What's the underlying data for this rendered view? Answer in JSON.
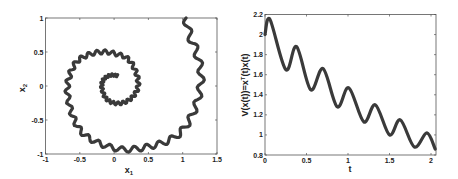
{
  "chart_data": [
    {
      "type": "line",
      "title": "",
      "xlabel": "x1",
      "ylabel": "x2",
      "xlim": [
        -1,
        1.5
      ],
      "ylim": [
        -1,
        1
      ],
      "xticks": [
        "-1",
        "-0.5",
        "0",
        "0.5",
        "1",
        "1.5"
      ],
      "yticks": [
        "-1",
        "-0.5",
        "0",
        "0.5",
        "1"
      ],
      "grid": false,
      "description": "Phase-plane trajectory spiraling inward (clockwise) with small high-frequency ripples, from about (1.05, 1.0) to about (0.05, 0.15)",
      "series": [
        {
          "name": "trajectory",
          "x": [
            1.05,
            1.1,
            1.2,
            1.27,
            1.22,
            1.1,
            0.95,
            0.75,
            0.55,
            0.35,
            0.1,
            -0.2,
            -0.45,
            -0.6,
            -0.68,
            -0.65,
            -0.55,
            -0.4,
            -0.2,
            0.0,
            0.2,
            0.32,
            0.35,
            0.28,
            0.15,
            0.0,
            -0.12,
            -0.18,
            -0.15,
            -0.05,
            0.05
          ],
          "y": [
            1.0,
            0.75,
            0.5,
            0.15,
            -0.2,
            -0.5,
            -0.7,
            -0.82,
            -0.88,
            -0.92,
            -0.93,
            -0.85,
            -0.7,
            -0.45,
            -0.1,
            0.15,
            0.35,
            0.45,
            0.5,
            0.48,
            0.4,
            0.2,
            0.0,
            -0.15,
            -0.24,
            -0.25,
            -0.18,
            -0.02,
            0.1,
            0.16,
            0.15
          ]
        }
      ]
    },
    {
      "type": "line",
      "title": "",
      "xlabel": "t",
      "ylabel": "V(x(t))=x^T(t)x(t)",
      "xlim": [
        0,
        2.06
      ],
      "ylim": [
        0.8,
        2.2
      ],
      "xticks": [
        "0",
        "0.5",
        "1",
        "1.5",
        "2"
      ],
      "yticks": [
        "0.8",
        "1",
        "1.2",
        "1.4",
        "1.6",
        "1.8",
        "2",
        "2.2"
      ],
      "grid": false,
      "series": [
        {
          "name": "V",
          "x": [
            0,
            0.06,
            0.25,
            0.38,
            0.55,
            0.7,
            0.87,
            1.01,
            1.19,
            1.33,
            1.5,
            1.63,
            1.8,
            1.95,
            2.05
          ],
          "y": [
            2.0,
            2.15,
            1.65,
            1.88,
            1.45,
            1.66,
            1.28,
            1.47,
            1.13,
            1.3,
            1.0,
            1.15,
            0.88,
            1.02,
            0.86
          ]
        }
      ]
    }
  ],
  "left": {
    "xlabel_main": "x",
    "xlabel_sub": "1",
    "ylabel_main": "x",
    "ylabel_sub": "2"
  },
  "right": {
    "xlabel": "t",
    "ylabel_pre": "V(x(t))=x",
    "ylabel_sup": "T",
    "ylabel_post": "(t)x(t)"
  }
}
